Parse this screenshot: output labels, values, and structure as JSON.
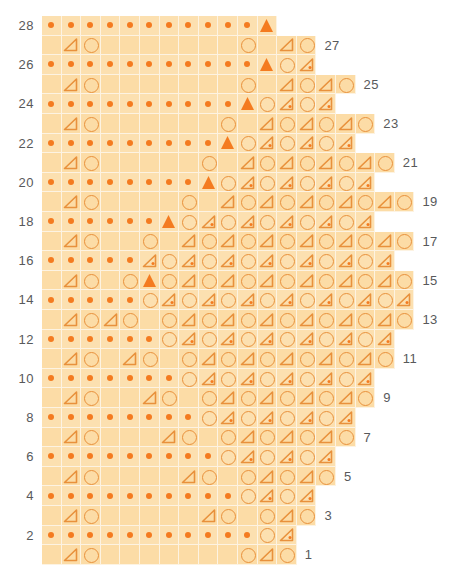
{
  "chart_data": {
    "type": "table",
    "rows_total": 28,
    "grid": {
      "cell_px": 19.6,
      "grid_left_px": 42,
      "grid_top_px": 16,
      "even_row_label_side": "left",
      "odd_row_label_side": "right"
    },
    "legend_symbols": {
      "dot": "single-dot-stitch",
      "circle": "yarn-over",
      "tri": "plain-decrease-triangle",
      "tri-dot": "dotted-decrease-triangle",
      "tri-fill": "filled-special-triangle",
      "blank": "no-stitch"
    },
    "colors": {
      "cell_light": "#fce0b0",
      "cell_alt": "#fcdca6",
      "grid_line": "#fdf3e2",
      "symbol_outline": "#e8913c",
      "symbol_fill": "#f47b20",
      "label_text": "#58595b",
      "page_background": "#ffffff"
    },
    "rows": [
      {
        "number": 28,
        "label": "28",
        "side": "left",
        "cells": [
          "dot",
          "dot",
          "dot",
          "dot",
          "dot",
          "dot",
          "dot",
          "dot",
          "dot",
          "dot",
          "dot",
          "tri-fill"
        ]
      },
      {
        "number": 27,
        "label": "27",
        "side": "right",
        "cells": [
          "blank",
          "tri",
          "circle",
          "blank",
          "blank",
          "blank",
          "blank",
          "blank",
          "blank",
          "blank",
          "circle",
          "blank",
          "tri",
          "circle"
        ]
      },
      {
        "number": 26,
        "label": "26",
        "side": "left",
        "cells": [
          "dot",
          "dot",
          "dot",
          "dot",
          "dot",
          "dot",
          "dot",
          "dot",
          "dot",
          "dot",
          "dot",
          "tri-fill",
          "circle",
          "tri-dot"
        ]
      },
      {
        "number": 25,
        "label": "25",
        "side": "right",
        "cells": [
          "blank",
          "tri",
          "circle",
          "blank",
          "blank",
          "blank",
          "blank",
          "blank",
          "blank",
          "blank",
          "circle",
          "blank",
          "tri",
          "circle",
          "tri",
          "circle"
        ]
      },
      {
        "number": 24,
        "label": "24",
        "side": "left",
        "cells": [
          "dot",
          "dot",
          "dot",
          "dot",
          "dot",
          "dot",
          "dot",
          "dot",
          "dot",
          "dot",
          "tri-fill",
          "circle",
          "tri-dot",
          "circle",
          "tri-dot"
        ]
      },
      {
        "number": 23,
        "label": "23",
        "side": "right",
        "cells": [
          "blank",
          "tri",
          "circle",
          "blank",
          "blank",
          "blank",
          "blank",
          "blank",
          "blank",
          "circle",
          "blank",
          "tri",
          "circle",
          "tri",
          "circle",
          "tri",
          "circle"
        ]
      },
      {
        "number": 22,
        "label": "22",
        "side": "left",
        "cells": [
          "dot",
          "dot",
          "dot",
          "dot",
          "dot",
          "dot",
          "dot",
          "dot",
          "dot",
          "tri-fill",
          "circle",
          "tri-dot",
          "circle",
          "tri-dot",
          "circle",
          "tri-dot"
        ]
      },
      {
        "number": 21,
        "label": "21",
        "side": "right",
        "cells": [
          "blank",
          "tri",
          "circle",
          "blank",
          "blank",
          "blank",
          "blank",
          "blank",
          "circle",
          "blank",
          "tri",
          "circle",
          "tri",
          "circle",
          "tri",
          "circle",
          "tri",
          "circle"
        ]
      },
      {
        "number": 20,
        "label": "20",
        "side": "left",
        "cells": [
          "dot",
          "dot",
          "dot",
          "dot",
          "dot",
          "dot",
          "dot",
          "dot",
          "tri-fill",
          "circle",
          "tri-dot",
          "circle",
          "tri-dot",
          "circle",
          "tri-dot",
          "circle",
          "tri-dot"
        ]
      },
      {
        "number": 19,
        "label": "19",
        "side": "right",
        "cells": [
          "blank",
          "tri",
          "circle",
          "blank",
          "blank",
          "blank",
          "blank",
          "circle",
          "blank",
          "tri",
          "circle",
          "tri",
          "circle",
          "tri",
          "circle",
          "tri",
          "circle",
          "tri",
          "circle"
        ]
      },
      {
        "number": 18,
        "label": "18",
        "side": "left",
        "cells": [
          "dot",
          "dot",
          "dot",
          "dot",
          "dot",
          "dot",
          "tri-fill",
          "circle",
          "tri-dot",
          "circle",
          "tri-dot",
          "circle",
          "tri-dot",
          "circle",
          "tri-dot",
          "circle",
          "tri-dot"
        ]
      },
      {
        "number": 17,
        "label": "17",
        "side": "right",
        "cells": [
          "blank",
          "tri",
          "circle",
          "blank",
          "blank",
          "circle",
          "blank",
          "tri",
          "circle",
          "tri",
          "circle",
          "tri",
          "circle",
          "tri",
          "circle",
          "tri",
          "circle",
          "tri",
          "circle"
        ]
      },
      {
        "number": 16,
        "label": "16",
        "side": "left",
        "cells": [
          "dot",
          "dot",
          "dot",
          "dot",
          "dot",
          "tri-dot",
          "circle",
          "tri-dot",
          "circle",
          "tri-dot",
          "circle",
          "tri-dot",
          "circle",
          "tri-dot",
          "circle",
          "tri-dot",
          "circle",
          "tri-dot"
        ]
      },
      {
        "number": 15,
        "label": "15",
        "side": "right",
        "cells": [
          "blank",
          "tri",
          "circle",
          "blank",
          "circle",
          "tri-fill",
          "circle",
          "tri",
          "circle",
          "tri",
          "circle",
          "tri",
          "circle",
          "tri",
          "circle",
          "tri",
          "circle",
          "tri",
          "circle"
        ]
      },
      {
        "number": 14,
        "label": "14",
        "side": "left",
        "cells": [
          "dot",
          "dot",
          "dot",
          "dot",
          "dot",
          "circle",
          "tri-dot",
          "circle",
          "tri-dot",
          "circle",
          "tri-dot",
          "circle",
          "tri-dot",
          "circle",
          "tri-dot",
          "circle",
          "tri-dot",
          "circle",
          "tri-dot"
        ]
      },
      {
        "number": 13,
        "label": "13",
        "side": "right",
        "cells": [
          "blank",
          "tri",
          "circle",
          "tri",
          "circle",
          "blank",
          "circle",
          "tri",
          "circle",
          "tri",
          "circle",
          "tri",
          "circle",
          "tri",
          "circle",
          "tri",
          "circle",
          "tri",
          "circle"
        ]
      },
      {
        "number": 12,
        "label": "12",
        "side": "left",
        "cells": [
          "dot",
          "dot",
          "dot",
          "dot",
          "dot",
          "dot",
          "circle",
          "tri-dot",
          "circle",
          "tri-dot",
          "circle",
          "tri-dot",
          "circle",
          "tri-dot",
          "circle",
          "tri-dot",
          "circle",
          "tri-dot"
        ]
      },
      {
        "number": 11,
        "label": "11",
        "side": "right",
        "cells": [
          "blank",
          "tri",
          "circle",
          "blank",
          "tri",
          "circle",
          "blank",
          "circle",
          "tri",
          "circle",
          "tri",
          "circle",
          "tri",
          "circle",
          "tri",
          "circle",
          "tri",
          "circle"
        ]
      },
      {
        "number": 10,
        "label": "10",
        "side": "left",
        "cells": [
          "dot",
          "dot",
          "dot",
          "dot",
          "dot",
          "dot",
          "dot",
          "circle",
          "tri-dot",
          "circle",
          "tri-dot",
          "circle",
          "tri-dot",
          "circle",
          "tri-dot",
          "circle",
          "tri-dot"
        ]
      },
      {
        "number": 9,
        "label": "9",
        "side": "right",
        "cells": [
          "blank",
          "tri",
          "circle",
          "blank",
          "blank",
          "tri",
          "circle",
          "blank",
          "circle",
          "tri",
          "circle",
          "tri",
          "circle",
          "tri",
          "circle",
          "tri",
          "circle"
        ]
      },
      {
        "number": 8,
        "label": "8",
        "side": "left",
        "cells": [
          "dot",
          "dot",
          "dot",
          "dot",
          "dot",
          "dot",
          "dot",
          "dot",
          "circle",
          "tri-dot",
          "circle",
          "tri-dot",
          "circle",
          "tri-dot",
          "circle",
          "tri-dot"
        ]
      },
      {
        "number": 7,
        "label": "7",
        "side": "right",
        "cells": [
          "blank",
          "tri",
          "circle",
          "blank",
          "blank",
          "blank",
          "tri",
          "circle",
          "blank",
          "circle",
          "tri",
          "circle",
          "tri",
          "circle",
          "tri",
          "circle"
        ]
      },
      {
        "number": 6,
        "label": "6",
        "side": "left",
        "cells": [
          "dot",
          "dot",
          "dot",
          "dot",
          "dot",
          "dot",
          "dot",
          "dot",
          "dot",
          "circle",
          "tri-dot",
          "circle",
          "tri-dot",
          "circle",
          "tri-dot"
        ]
      },
      {
        "number": 5,
        "label": "5",
        "side": "right",
        "cells": [
          "blank",
          "tri",
          "circle",
          "blank",
          "blank",
          "blank",
          "blank",
          "tri",
          "circle",
          "blank",
          "circle",
          "tri",
          "circle",
          "tri",
          "circle"
        ]
      },
      {
        "number": 4,
        "label": "4",
        "side": "left",
        "cells": [
          "dot",
          "dot",
          "dot",
          "dot",
          "dot",
          "dot",
          "dot",
          "dot",
          "dot",
          "dot",
          "circle",
          "tri-dot",
          "circle",
          "tri-dot"
        ]
      },
      {
        "number": 3,
        "label": "3",
        "side": "right",
        "cells": [
          "blank",
          "tri",
          "circle",
          "blank",
          "blank",
          "blank",
          "blank",
          "blank",
          "tri",
          "circle",
          "blank",
          "circle",
          "tri",
          "circle"
        ]
      },
      {
        "number": 2,
        "label": "2",
        "side": "left",
        "cells": [
          "dot",
          "dot",
          "dot",
          "dot",
          "dot",
          "dot",
          "dot",
          "dot",
          "dot",
          "dot",
          "dot",
          "circle",
          "tri-dot"
        ]
      },
      {
        "number": 1,
        "label": "1",
        "side": "right",
        "cells": [
          "blank",
          "tri",
          "circle",
          "blank",
          "blank",
          "blank",
          "blank",
          "blank",
          "blank",
          "blank",
          "circle",
          "tri",
          "circle"
        ]
      }
    ]
  }
}
